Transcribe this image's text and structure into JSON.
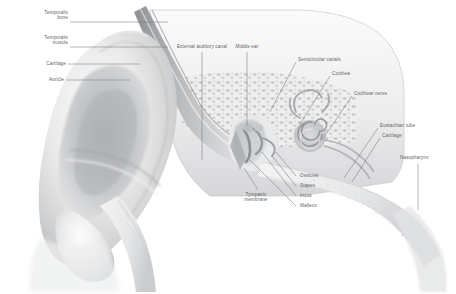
{
  "figure": {
    "kind": "anatomical-illustration",
    "background_color": "#ffffff",
    "label_color": "#5d5f61",
    "leader_color": "#77797c"
  },
  "labels": {
    "temporalis_bone": "Temporalis\nbone",
    "temporalis_muscle": "Temporalis\nmuscle",
    "cartilage_left": "Cartilage",
    "auricle": "Auricle",
    "external_auditory_canal": "External auditory canal",
    "middle_ear": "Middle ear",
    "semicircular_canals": "Semicircular canals",
    "cochlea": "Cochlea",
    "cochlear_nerve": "Cochlear nerve",
    "eustachian_tube": "Eustachian tube",
    "cartilage_right": "Cartilage",
    "nasopharynx": "Nasopharynx",
    "tympanic_membrane": "Tympanic\nmembrane",
    "ossicles": "Ossicles",
    "stapes": "Stapes",
    "incus": "Incus",
    "malleus": "Malleus"
  }
}
